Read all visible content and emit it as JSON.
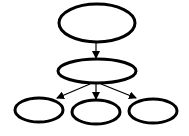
{
  "diagram": {
    "type": "tree",
    "stroke_color": "#000000",
    "background": "#ffffff",
    "nodes": [
      {
        "id": "root",
        "label": "",
        "cx": 97,
        "cy": 23,
        "rx": 38,
        "ry": 19
      },
      {
        "id": "middle",
        "label": "",
        "cx": 97,
        "cy": 71,
        "rx": 39,
        "ry": 12
      },
      {
        "id": "leaf-left",
        "label": "",
        "cx": 39,
        "cy": 110,
        "rx": 24,
        "ry": 12
      },
      {
        "id": "leaf-center",
        "label": "",
        "cx": 96,
        "cy": 112,
        "rx": 24,
        "ry": 12
      },
      {
        "id": "leaf-right",
        "label": "",
        "cx": 153,
        "cy": 111,
        "rx": 24,
        "ry": 12
      }
    ],
    "edges": [
      {
        "from": "root",
        "to": "middle",
        "x1": 96,
        "y1": 42,
        "x2": 96,
        "y2": 58
      },
      {
        "from": "middle",
        "to": "leaf-left",
        "x1": 90,
        "y1": 84,
        "x2": 57,
        "y2": 98
      },
      {
        "from": "middle",
        "to": "leaf-center",
        "x1": 96,
        "y1": 84,
        "x2": 96,
        "y2": 99
      },
      {
        "from": "middle",
        "to": "leaf-right",
        "x1": 101,
        "y1": 84,
        "x2": 136,
        "y2": 98
      }
    ]
  }
}
